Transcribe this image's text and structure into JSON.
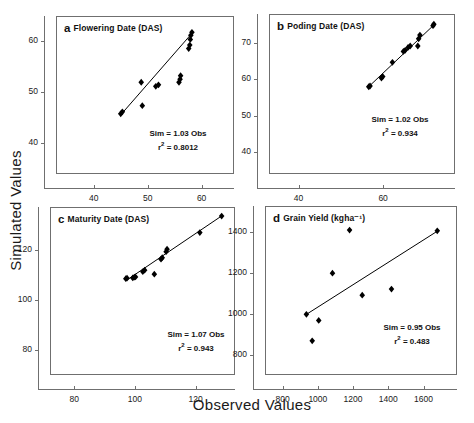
{
  "figure": {
    "xlabel": "Observed Values",
    "ylabel": "Simulated Values",
    "background": "#ffffff",
    "point_color": "#000000",
    "line_color": "#000000",
    "axis_color": "#6f6f6f"
  },
  "chart_data": [
    {
      "type": "scatter",
      "panel": "a",
      "letter": "a",
      "title": "Flowering Date (DAS)",
      "xlabel": "Observed Values",
      "ylabel": "Simulated Values",
      "xlim": [
        33,
        66
      ],
      "ylim": [
        34,
        65
      ],
      "xticks": [
        40,
        50,
        60
      ],
      "yticks": [
        40,
        50,
        60
      ],
      "grid": false,
      "annotation_slope": "Sim = 1.03 Obs",
      "annotation_r2": "r² = 0.8012",
      "slope": 1.03,
      "r2": 0.8012,
      "points": [
        {
          "x": 45.0,
          "y": 45.8
        },
        {
          "x": 45.3,
          "y": 46.2
        },
        {
          "x": 49.0,
          "y": 47.4
        },
        {
          "x": 48.8,
          "y": 52.0
        },
        {
          "x": 51.5,
          "y": 51.2
        },
        {
          "x": 52.0,
          "y": 51.5
        },
        {
          "x": 55.8,
          "y": 52.0
        },
        {
          "x": 56.0,
          "y": 52.6
        },
        {
          "x": 56.1,
          "y": 53.3
        },
        {
          "x": 57.6,
          "y": 58.6
        },
        {
          "x": 57.8,
          "y": 59.3
        },
        {
          "x": 57.9,
          "y": 60.4
        },
        {
          "x": 58.0,
          "y": 61.2
        },
        {
          "x": 58.2,
          "y": 61.8
        }
      ],
      "fit": {
        "x1": 45.0,
        "y1": 45.6,
        "x2": 58.2,
        "y2": 61.6
      }
    },
    {
      "type": "scatter",
      "panel": "b",
      "letter": "b",
      "title": "Poding Date (DAS)",
      "xlabel": "Observed Values",
      "ylabel": "Simulated Values",
      "xlim": [
        33,
        77
      ],
      "ylim": [
        34,
        78
      ],
      "xticks": [
        40,
        60
      ],
      "yticks": [
        40,
        50,
        60,
        70
      ],
      "grid": false,
      "annotation_slope": "Sim = 1.02 Obs",
      "annotation_r2": "r² = 0.934",
      "slope": 1.02,
      "r2": 0.934,
      "points": [
        {
          "x": 56.6,
          "y": 58.0
        },
        {
          "x": 56.9,
          "y": 58.2
        },
        {
          "x": 59.6,
          "y": 60.4
        },
        {
          "x": 59.9,
          "y": 60.8
        },
        {
          "x": 62.2,
          "y": 64.7
        },
        {
          "x": 64.8,
          "y": 67.7
        },
        {
          "x": 65.2,
          "y": 68.0
        },
        {
          "x": 65.9,
          "y": 68.8
        },
        {
          "x": 66.4,
          "y": 69.2
        },
        {
          "x": 68.2,
          "y": 69.2
        },
        {
          "x": 68.4,
          "y": 71.2
        },
        {
          "x": 68.7,
          "y": 72.2
        },
        {
          "x": 71.8,
          "y": 74.8
        },
        {
          "x": 72.0,
          "y": 75.2
        }
      ],
      "fit": {
        "x1": 56.4,
        "y1": 57.8,
        "x2": 72.2,
        "y2": 75.2
      }
    },
    {
      "type": "scatter",
      "panel": "c",
      "letter": "c",
      "title": "Maturity Date (DAS)",
      "xlabel": "Observed Values",
      "ylabel": "Simulated Values",
      "xlim": [
        72,
        133
      ],
      "ylim": [
        70,
        137
      ],
      "xticks": [
        80,
        100,
        120
      ],
      "yticks": [
        80,
        100,
        120
      ],
      "grid": false,
      "annotation_slope": "Sim = 1.07 Obs",
      "annotation_r2": "r² = 0.943",
      "slope": 1.07,
      "r2": 0.943,
      "points": [
        {
          "x": 97.0,
          "y": 108.4
        },
        {
          "x": 97.4,
          "y": 108.6
        },
        {
          "x": 99.3,
          "y": 108.7
        },
        {
          "x": 99.8,
          "y": 109.0
        },
        {
          "x": 100.2,
          "y": 109.1
        },
        {
          "x": 102.6,
          "y": 111.2
        },
        {
          "x": 103.2,
          "y": 111.8
        },
        {
          "x": 106.4,
          "y": 110.2
        },
        {
          "x": 108.6,
          "y": 116.2
        },
        {
          "x": 109.0,
          "y": 116.8
        },
        {
          "x": 110.3,
          "y": 119.2
        },
        {
          "x": 110.6,
          "y": 120.2
        },
        {
          "x": 121.4,
          "y": 126.8
        },
        {
          "x": 128.6,
          "y": 133.4
        }
      ],
      "fit": {
        "x1": 97.0,
        "y1": 107.6,
        "x2": 128.8,
        "y2": 133.6
      }
    },
    {
      "type": "scatter",
      "panel": "d",
      "letter": "d",
      "title": "Grain Yield (kgha⁻¹)",
      "xlabel": "Observed Values",
      "ylabel": "Simulated Values",
      "xlim": [
        700,
        1790
      ],
      "ylim": [
        700,
        1530
      ],
      "xticks": [
        800,
        1000,
        1200,
        1400,
        1600
      ],
      "yticks": [
        800,
        1000,
        1200,
        1400
      ],
      "grid": false,
      "annotation_slope": "Sim = 0.95 Obs",
      "annotation_r2": "r² = 0.483",
      "slope": 0.95,
      "r2": 0.483,
      "points": [
        {
          "x": 935,
          "y": 998
        },
        {
          "x": 968,
          "y": 868
        },
        {
          "x": 1005,
          "y": 968
        },
        {
          "x": 1083,
          "y": 1200
        },
        {
          "x": 1180,
          "y": 1412
        },
        {
          "x": 1252,
          "y": 1092
        },
        {
          "x": 1418,
          "y": 1122
        },
        {
          "x": 1678,
          "y": 1408
        }
      ],
      "fit": {
        "x1": 930,
        "y1": 995,
        "x2": 1685,
        "y2": 1410
      }
    }
  ]
}
